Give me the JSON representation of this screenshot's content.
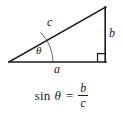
{
  "figure": {
    "kind": "right-triangle-trigonometry-diagram",
    "background_color": "#ffffff",
    "stroke_color": "#1a1a1a",
    "labels": {
      "hypotenuse": "c",
      "opposite_side": "b",
      "adjacent_side": "a",
      "angle": "θ"
    },
    "geometry": {
      "left_vertex": [
        9,
        62
      ],
      "right_vertex": [
        106,
        62
      ],
      "apex_vertex": [
        106,
        7
      ],
      "right_angle_marker": true,
      "angle_arc": true
    }
  },
  "equation": {
    "function_name": "sin",
    "angle_symbol": "θ",
    "equals": "=",
    "numerator": "b",
    "denominator": "c",
    "full_text": "sin θ = b/c"
  }
}
